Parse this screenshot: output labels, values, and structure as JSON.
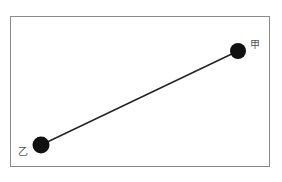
{
  "diagram": {
    "frame": {
      "x": 10,
      "y": 16,
      "width": 260,
      "height": 151,
      "stroke": "#8a8a8a"
    },
    "nodes": [
      {
        "id": "jia",
        "label": "甲",
        "cx": 238,
        "cy": 51,
        "r": 8,
        "label_x": 252,
        "label_y": 45
      },
      {
        "id": "yi",
        "label": "乙",
        "cx": 41,
        "cy": 145,
        "r": 8.5,
        "label_x": 19,
        "label_y": 155
      }
    ],
    "edges": [
      {
        "from": "yi",
        "to": "jia"
      }
    ],
    "colors": {
      "node": "#111111",
      "line": "#222222",
      "label": "#555555"
    }
  }
}
